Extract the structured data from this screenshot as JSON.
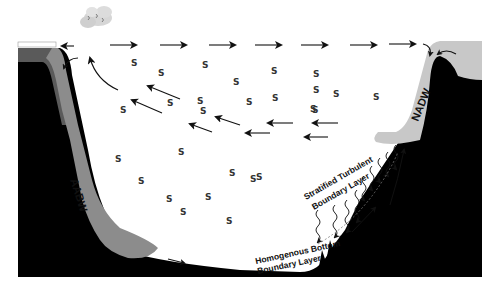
{
  "diagram": {
    "type": "ocean basin cross-section",
    "labels": {
      "left_water_mass": "AABW",
      "right_water_mass": "NADW",
      "stratified_line1": "Stratified Turbulent",
      "stratified_line2": "Boundary Layer",
      "homogenous_line1": "Homogenous Bottom",
      "homogenous_line2": "Boundary Layer"
    },
    "mixing_symbol": "S",
    "colors": {
      "seafloor": "#000000",
      "water": "#ffffff",
      "aabw": "#8c8c8c",
      "aabw_dark": "#5a5a5a",
      "nadw": "#c8c8c8",
      "arrows": "#111111",
      "cloud": "#d0d0d0"
    },
    "elements": {
      "surface_arrows_count": 8,
      "interior_return_arrows_count": 10,
      "mixing_symbols_count": 27,
      "wavy_turbulence_count": 9,
      "cloud": "cloud-icon"
    }
  }
}
